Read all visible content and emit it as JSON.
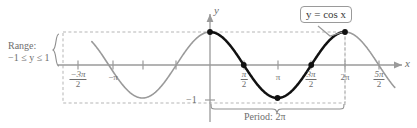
{
  "figure": {
    "axis_labels": {
      "x": "x",
      "y": "y"
    },
    "callout": {
      "text": "y = cos x"
    },
    "range_annotation": {
      "line1": "Range:",
      "line2": "−1 ≤ y ≤ 1"
    },
    "period_annotation": {
      "text": "Period: 2π"
    },
    "y_tick_label": "−1",
    "colors": {
      "curve_highlight": "#111111",
      "curve_faint": "#9a9a9a",
      "axis": "#9a9a9a",
      "text": "#6e6e6e",
      "text_dark": "#3a3a3a",
      "dashed": "#b0b0b0",
      "background": "#ffffff"
    },
    "x_ticks": [
      {
        "id": "neg-3pi-over-2",
        "num": "−3π",
        "den": "2",
        "type": "fraction",
        "x": 78
      },
      {
        "id": "neg-pi",
        "label": "−π",
        "type": "plain",
        "x": 113
      },
      {
        "id": "pi-over-2",
        "num": "π",
        "den": "2",
        "type": "fraction",
        "x": 244
      },
      {
        "id": "pi",
        "label": "π",
        "type": "plain",
        "x": 278
      },
      {
        "id": "3pi-over-2",
        "num": "3π",
        "den": "2",
        "type": "fraction",
        "x": 311
      },
      {
        "id": "2pi",
        "label": "2π",
        "type": "plain",
        "x": 345
      },
      {
        "id": "5pi-over-2",
        "num": "5π",
        "den": "2",
        "type": "fraction",
        "x": 379
      }
    ]
  },
  "chart_data": {
    "type": "line",
    "title": "y = cos x",
    "xlabel": "x",
    "ylabel": "y",
    "function": "y = cos x",
    "xlim": [
      -5.5,
      8.6
    ],
    "ylim": [
      -1.45,
      1.45
    ],
    "grid": false,
    "legend": "none",
    "period": 6.283185307179586,
    "range": [
      -1,
      1
    ],
    "x_tick_values": [
      -4.71238898038469,
      -3.141592653589793,
      1.570796326794897,
      3.141592653589793,
      4.71238898038469,
      6.283185307179586,
      7.853981633974483
    ],
    "x_tick_labels": [
      "-3π/2",
      "-π",
      "π/2",
      "π",
      "3π/2",
      "2π",
      "5π/2"
    ],
    "y_tick_values": [
      -1
    ],
    "y_tick_labels": [
      "-1"
    ],
    "series": [
      {
        "name": "y = cos x (highlighted period)",
        "color": "#111111",
        "x_start": 0,
        "x_end": 6.283185307179586,
        "style": "solid-thick"
      },
      {
        "name": "y = cos x (outside period)",
        "color": "#9a9a9a",
        "x_start": -5.5,
        "x_end": 8.6,
        "style": "solid-thin"
      }
    ],
    "marked_points": [
      {
        "x": 0,
        "y": 1,
        "label": "(0, 1)"
      },
      {
        "x": 1.570796326794897,
        "y": 0,
        "label": "(π/2, 0)"
      },
      {
        "x": 3.141592653589793,
        "y": -1,
        "label": "(π, -1)"
      },
      {
        "x": 4.71238898038469,
        "y": 0,
        "label": "(3π/2, 0)"
      },
      {
        "x": 6.283185307179586,
        "y": 1,
        "label": "(2π, 1)"
      }
    ],
    "annotations": [
      {
        "text": "y = cos x",
        "kind": "callout-box",
        "points_to": [
          6.283185307179586,
          1
        ]
      },
      {
        "text": "Range: -1 ≤ y ≤ 1",
        "kind": "brace-left"
      },
      {
        "text": "Period: 2π",
        "kind": "brace-bottom",
        "span": [
          0,
          6.283185307179586
        ]
      }
    ]
  }
}
